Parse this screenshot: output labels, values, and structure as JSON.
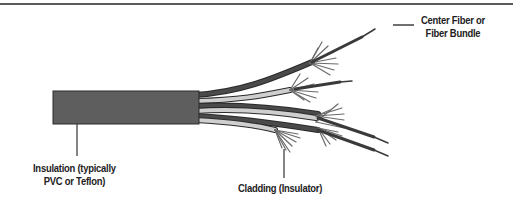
{
  "diagram": {
    "type": "labeled-illustration",
    "labels": {
      "insulation": {
        "line1": "Insulation (typically",
        "line2": "PVC or Teflon)"
      },
      "cladding": {
        "line1": "Cladding (Insulator)"
      },
      "center_fiber": {
        "line1": "Center Fiber or",
        "line2": "Fiber Bundle"
      }
    },
    "colors": {
      "jacket": "#5e5e5e",
      "outline": "#2a2a2a",
      "cladding_light": "#c9c9c9",
      "cladding_dark": "#4a4a4a",
      "strands": "#6a6a6a",
      "leader": "#333333",
      "rule": "#5a5a5a"
    }
  }
}
